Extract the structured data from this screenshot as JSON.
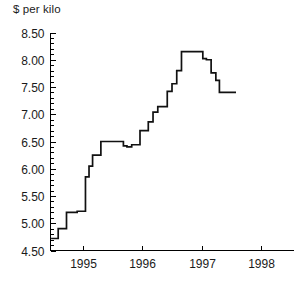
{
  "chart_data": {
    "type": "line",
    "title": "",
    "subtitle": "",
    "xlabel": "",
    "ylabel": "$ per kilo",
    "ylim": [
      4.5,
      8.5
    ],
    "xlim": [
      1994.45,
      1998.55
    ],
    "grid": false,
    "legend": null,
    "annotations": [],
    "y_ticks": [
      4.5,
      5.0,
      5.5,
      6.0,
      6.5,
      7.0,
      7.5,
      8.0,
      8.5
    ],
    "y_tick_labels": [
      "4.50",
      "5.00",
      "5.50",
      "6.00",
      "6.50",
      "7.00",
      "7.50",
      "8.00",
      "8.50"
    ],
    "y_minor_tick_step": 0.1,
    "x_ticks": [
      1995,
      1996,
      1997,
      1998
    ],
    "x_tick_labels": [
      "1995",
      "1996",
      "1997",
      "1998"
    ],
    "series": [
      {
        "name": "price",
        "step": true,
        "x": [
          1994.46,
          1994.54,
          1994.58,
          1994.63,
          1994.72,
          1994.8,
          1994.9,
          1994.98,
          1995.04,
          1995.1,
          1995.16,
          1995.22,
          1995.3,
          1995.62,
          1995.68,
          1995.74,
          1995.82,
          1995.88,
          1995.96,
          1996.02,
          1996.1,
          1996.18,
          1996.26,
          1996.34,
          1996.42,
          1996.5,
          1996.58,
          1996.66,
          1996.82,
          1996.96,
          1997.02,
          1997.08,
          1997.16,
          1997.24,
          1997.3,
          1997.58
        ],
        "y": [
          4.72,
          4.72,
          4.9,
          4.9,
          5.2,
          5.2,
          5.22,
          5.22,
          5.85,
          6.05,
          6.25,
          6.25,
          6.5,
          6.5,
          6.42,
          6.4,
          6.44,
          6.44,
          6.7,
          6.7,
          6.86,
          7.04,
          7.14,
          7.14,
          7.42,
          7.56,
          7.8,
          8.15,
          8.15,
          8.15,
          8.02,
          8.0,
          7.76,
          7.62,
          7.4,
          7.4
        ]
      }
    ]
  }
}
